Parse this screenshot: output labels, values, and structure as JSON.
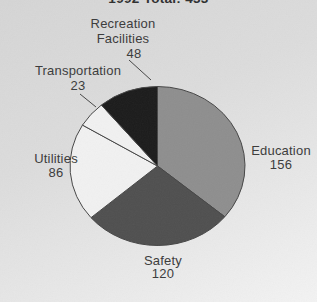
{
  "title": "1992 Total: 433",
  "chart_data": {
    "type": "pie",
    "title": "1992 Total: 433",
    "total": 433,
    "start_angle_deg": 0,
    "direction": "clockwise",
    "outline_color": "#454545",
    "slices": [
      {
        "label": "Education",
        "value": 156,
        "color": "#8e8e8e"
      },
      {
        "label": "Safety",
        "value": 120,
        "color": "#4f4f4f"
      },
      {
        "label": "Utilities",
        "value": 86,
        "color": "#f1f1f1"
      },
      {
        "label": "Transportation",
        "value": 23,
        "color": "#f1f1f1"
      },
      {
        "label": "Recreation Facilities",
        "value": 48,
        "color": "#1b1b1b"
      }
    ],
    "leader_lines": [
      {
        "name": "recreation-facilities",
        "x1": 129,
        "y1": 60,
        "x2": 151,
        "y2": 80
      },
      {
        "name": "transportation",
        "x1": 80,
        "y1": 94,
        "x2": 96,
        "y2": 107
      }
    ],
    "legend_position": "none",
    "grid": false
  },
  "labels": {
    "recreation": {
      "line1": "Recreation",
      "line2": "Facilities",
      "value": "48"
    },
    "transportation": {
      "line1": "Transportation",
      "value": "23"
    },
    "utilities": {
      "line1": "Utilities",
      "value": "86"
    },
    "education": {
      "line1": "Education",
      "value": "156"
    },
    "safety": {
      "line1": "Safety",
      "value": "120"
    }
  }
}
